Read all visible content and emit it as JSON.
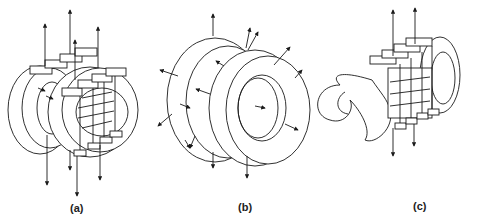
{
  "figure": {
    "panels": [
      {
        "id": "a",
        "label": "(a)",
        "description": "two elliptical coil rings with crossbar clamps and vertical force arrows"
      },
      {
        "id": "b",
        "label": "(b)",
        "description": "two coaxial toroidal rings with radial force arrows"
      },
      {
        "id": "c",
        "label": "(c)",
        "description": "twisted S-shaped coil with crossbar clamps and vertical force arrows"
      }
    ]
  }
}
